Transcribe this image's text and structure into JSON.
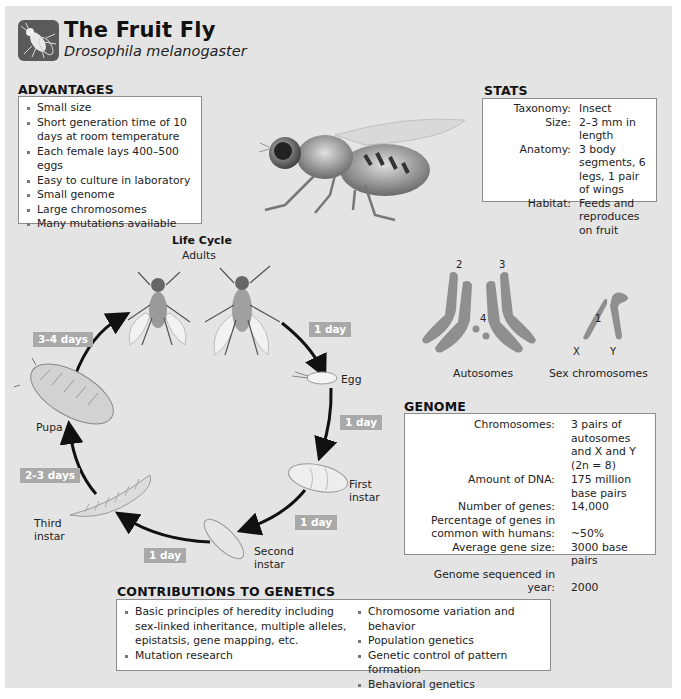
{
  "header": {
    "title": "The Fruit Fly",
    "subtitle": "Drosophila melanogaster",
    "logo_icon": "fruit-fly-icon"
  },
  "advantages": {
    "heading": "ADVANTAGES",
    "items": [
      "Small size",
      "Short generation time of 10 days at room temperature",
      "Each female lays 400–500 eggs",
      "Easy to culture in laboratory",
      "Small genome",
      "Large chromosomes",
      "Many mutations available"
    ]
  },
  "stats": {
    "heading": "STATS",
    "rows": [
      {
        "key": "Taxonomy:",
        "value": "Insect"
      },
      {
        "key": "Size:",
        "value": "2–3 mm in length"
      },
      {
        "key": "Anatomy:",
        "value": "3 body segments, 6 legs, 1 pair of wings"
      },
      {
        "key": "Habitat:",
        "value": "Feeds and reproduces on fruit"
      }
    ]
  },
  "life_cycle": {
    "title": "Life Cycle",
    "stages": {
      "adults": "Adults",
      "egg": "Egg",
      "first_instar": "First instar",
      "second_instar": "Second instar",
      "third_instar": "Third instar",
      "pupa": "Pupa"
    },
    "durations": {
      "adults_to_egg": "1 day",
      "egg_to_first": "1 day",
      "first_to_second": "1 day",
      "second_to_third": "1 day",
      "third_to_pupa": "2-3 days",
      "pupa_to_adults": "3-4 days"
    },
    "badge_color": "#a9a9a9"
  },
  "chromosomes": {
    "autosomes_label": "Autosomes",
    "sex_label": "Sex chromosomes",
    "numbers": {
      "two": "2",
      "three": "3",
      "four": "4",
      "one": "1"
    },
    "x_label": "X",
    "y_label": "Y",
    "color": "#8f8f8f"
  },
  "genome": {
    "heading": "GENOME",
    "rows": [
      {
        "key": "Chromosomes:",
        "value": "3 pairs of autosomes and X and Y (2n = 8)"
      },
      {
        "key": "Amount of DNA:",
        "value": "175 million base pairs"
      },
      {
        "key": "Number of genes:",
        "value": "14,000"
      },
      {
        "key": "Percentage of genes in common with humans:",
        "value": "~50%"
      },
      {
        "key": "Average gene size:",
        "value": "3000 base pairs"
      },
      {
        "key": "Genome sequenced in year:",
        "value": "2000"
      }
    ]
  },
  "contributions": {
    "heading": "CONTRIBUTIONS TO GENETICS",
    "left": [
      "Basic principles of heredity including sex-linked inheritance, multiple alleles, epistatsis, gene mapping, etc.",
      "Mutation research"
    ],
    "right": [
      "Chromosome variation and behavior",
      "Population genetics",
      "Genetic control of pattern formation",
      "Behavioral genetics"
    ]
  }
}
